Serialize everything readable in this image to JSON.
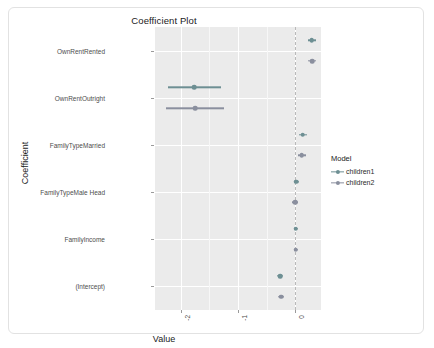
{
  "chart_data": {
    "type": "scatter",
    "title": "Coefficient Plot",
    "xlabel": "Value",
    "ylabel": "Coefficient",
    "xlim": [
      -2.45,
      0.45
    ],
    "xticks": [
      -2,
      -1,
      0
    ],
    "xticklabels": [
      "-2",
      "-1",
      "0"
    ],
    "grid": true,
    "zero_reference_line": 0,
    "legend": {
      "title": "Model",
      "position": "right",
      "entries": [
        "children1",
        "children2"
      ]
    },
    "categories": [
      "OwnRentRented",
      "OwnRentOutright",
      "FamilyTypeMarried",
      "FamilyTypeMale Head",
      "FamilyIncome",
      "(Intercept)"
    ],
    "series": [
      {
        "name": "children1",
        "color": "#6d8f93",
        "estimates": [
          0.29,
          -1.76,
          0.13,
          0.02,
          0.01,
          -0.26
        ],
        "conf_low": [
          0.22,
          -2.22,
          0.06,
          -0.03,
          -0.02,
          -0.31
        ],
        "conf_high": [
          0.36,
          -1.29,
          0.2,
          0.07,
          0.04,
          -0.21
        ]
      },
      {
        "name": "children2",
        "color": "#8a8f9e",
        "estimates": [
          0.3,
          -1.75,
          0.11,
          0.0,
          0.01,
          -0.25
        ],
        "conf_low": [
          0.23,
          -2.25,
          0.04,
          -0.05,
          -0.02,
          -0.3
        ],
        "conf_high": [
          0.37,
          -1.25,
          0.18,
          0.05,
          0.04,
          -0.2
        ]
      }
    ]
  },
  "plot": {
    "title": "Coefficient Plot",
    "xaxis_title": "Value",
    "yaxis_title": "Coefficient",
    "xtick_labels": [
      "-2",
      "-1",
      "0"
    ],
    "ytick_labels": [
      "OwnRentRented",
      "OwnRentOutright",
      "FamilyTypeMarried",
      "FamilyTypeMale Head",
      "FamilyIncome",
      "(Intercept)"
    ]
  },
  "legend": {
    "title": "Model",
    "items": [
      {
        "label": "children1",
        "color": "#6d8f93"
      },
      {
        "label": "children2",
        "color": "#8a8f9e"
      }
    ]
  },
  "colors": {
    "panel_background": "#ebebeb",
    "gridline": "#ffffff",
    "zero_line": "#b9b9b9",
    "card_background": "#ffffff",
    "card_border": "#e2e2e2",
    "children1": "#6d8f93",
    "children2": "#8a8f9e"
  }
}
